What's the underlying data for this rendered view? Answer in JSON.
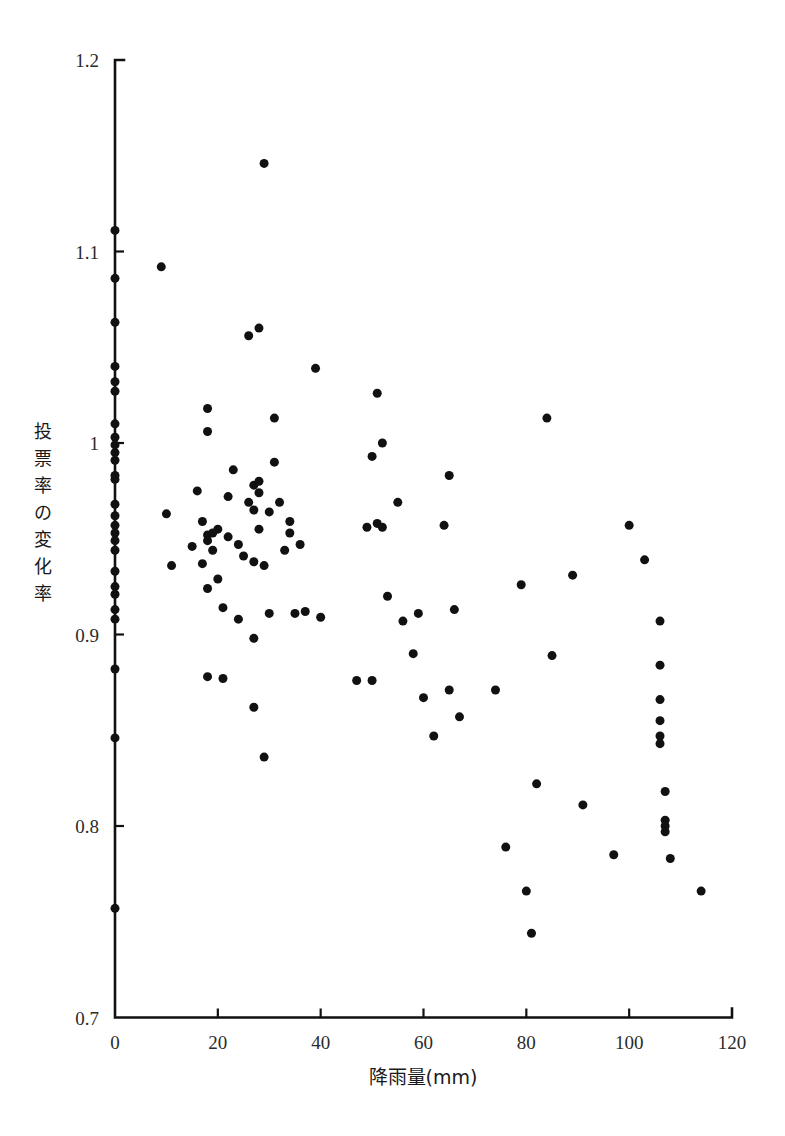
{
  "chart_data": {
    "type": "scatter",
    "title": "",
    "xlabel": "降雨量(mm)",
    "ylabel": "投票率の変化率",
    "ylabel_chars": [
      "投",
      "票",
      "率",
      "の",
      "変",
      "化",
      "率"
    ],
    "xlim": [
      0,
      120
    ],
    "ylim": [
      0.7,
      1.2
    ],
    "xticks": [
      0,
      20,
      40,
      60,
      80,
      100,
      120
    ],
    "xtick_labels": [
      "0",
      "20",
      "40",
      "60",
      "80",
      "100",
      "120"
    ],
    "yticks": [
      0.7,
      0.8,
      0.9,
      1.0,
      1.1,
      1.2
    ],
    "ytick_labels": [
      "0.7",
      "0.8",
      "0.9",
      "1",
      "1.1",
      "1.2"
    ],
    "grid": false,
    "legend": null,
    "marker": "filled-circle",
    "marker_color": "#111111",
    "marker_size_px": 9,
    "n_points": 134,
    "points": [
      [
        0,
        1.111
      ],
      [
        0,
        1.086
      ],
      [
        0,
        1.063
      ],
      [
        0,
        1.04
      ],
      [
        0,
        1.032
      ],
      [
        0,
        1.027
      ],
      [
        0,
        1.01
      ],
      [
        0,
        1.003
      ],
      [
        0,
        0.999
      ],
      [
        0,
        0.995
      ],
      [
        0,
        0.991
      ],
      [
        0,
        0.983
      ],
      [
        0,
        0.981
      ],
      [
        0,
        0.968
      ],
      [
        0,
        0.962
      ],
      [
        0,
        0.957
      ],
      [
        0,
        0.953
      ],
      [
        0,
        0.949
      ],
      [
        0,
        0.944
      ],
      [
        0,
        0.933
      ],
      [
        0,
        0.925
      ],
      [
        0,
        0.921
      ],
      [
        0,
        0.913
      ],
      [
        0,
        0.908
      ],
      [
        0,
        0.882
      ],
      [
        0,
        0.846
      ],
      [
        0,
        0.757
      ],
      [
        9,
        1.092
      ],
      [
        10,
        0.963
      ],
      [
        11,
        0.936
      ],
      [
        15,
        0.946
      ],
      [
        16,
        0.975
      ],
      [
        17,
        0.937
      ],
      [
        17,
        0.959
      ],
      [
        18,
        1.006
      ],
      [
        18,
        1.018
      ],
      [
        18,
        0.952
      ],
      [
        18,
        0.949
      ],
      [
        19,
        0.953
      ],
      [
        19,
        0.944
      ],
      [
        18,
        0.924
      ],
      [
        18,
        0.878
      ],
      [
        20,
        0.929
      ],
      [
        20,
        0.955
      ],
      [
        21,
        0.914
      ],
      [
        21,
        0.877
      ],
      [
        22,
        0.972
      ],
      [
        22,
        0.951
      ],
      [
        23,
        0.986
      ],
      [
        24,
        0.947
      ],
      [
        24,
        0.908
      ],
      [
        25,
        0.941
      ],
      [
        26,
        0.969
      ],
      [
        26,
        1.056
      ],
      [
        27,
        0.978
      ],
      [
        27,
        0.965
      ],
      [
        27,
        0.938
      ],
      [
        27,
        0.862
      ],
      [
        27,
        0.898
      ],
      [
        28,
        1.06
      ],
      [
        28,
        0.974
      ],
      [
        28,
        0.98
      ],
      [
        28,
        0.955
      ],
      [
        29,
        0.936
      ],
      [
        29,
        1.146
      ],
      [
        29,
        0.836
      ],
      [
        30,
        0.964
      ],
      [
        30,
        0.911
      ],
      [
        31,
        0.99
      ],
      [
        31,
        1.013
      ],
      [
        32,
        0.969
      ],
      [
        33,
        0.944
      ],
      [
        34,
        0.959
      ],
      [
        34,
        0.953
      ],
      [
        35,
        0.911
      ],
      [
        36,
        0.947
      ],
      [
        37,
        0.912
      ],
      [
        39,
        1.039
      ],
      [
        40,
        0.909
      ],
      [
        47,
        0.876
      ],
      [
        49,
        0.956
      ],
      [
        50,
        0.876
      ],
      [
        50,
        0.993
      ],
      [
        51,
        1.026
      ],
      [
        51,
        0.958
      ],
      [
        52,
        0.956
      ],
      [
        52,
        1.0
      ],
      [
        53,
        0.92
      ],
      [
        55,
        0.969
      ],
      [
        56,
        0.907
      ],
      [
        58,
        0.89
      ],
      [
        59,
        0.911
      ],
      [
        60,
        0.867
      ],
      [
        62,
        0.847
      ],
      [
        64,
        0.957
      ],
      [
        65,
        0.983
      ],
      [
        65,
        0.871
      ],
      [
        66,
        0.913
      ],
      [
        67,
        0.857
      ],
      [
        74,
        0.871
      ],
      [
        76,
        0.789
      ],
      [
        79,
        0.926
      ],
      [
        80,
        0.766
      ],
      [
        81,
        0.744
      ],
      [
        82,
        0.822
      ],
      [
        84,
        1.013
      ],
      [
        85,
        0.889
      ],
      [
        89,
        0.931
      ],
      [
        91,
        0.811
      ],
      [
        97,
        0.785
      ],
      [
        100,
        0.957
      ],
      [
        103,
        0.939
      ],
      [
        106,
        0.907
      ],
      [
        106,
        0.884
      ],
      [
        106,
        0.866
      ],
      [
        106,
        0.855
      ],
      [
        106,
        0.847
      ],
      [
        106,
        0.843
      ],
      [
        107,
        0.818
      ],
      [
        107,
        0.803
      ],
      [
        107,
        0.8
      ],
      [
        107,
        0.797
      ],
      [
        108,
        0.783
      ],
      [
        114,
        0.766
      ]
    ]
  },
  "axes": {
    "x_axis_name": "rainfall-axis",
    "y_axis_name": "vote-change-axis"
  }
}
